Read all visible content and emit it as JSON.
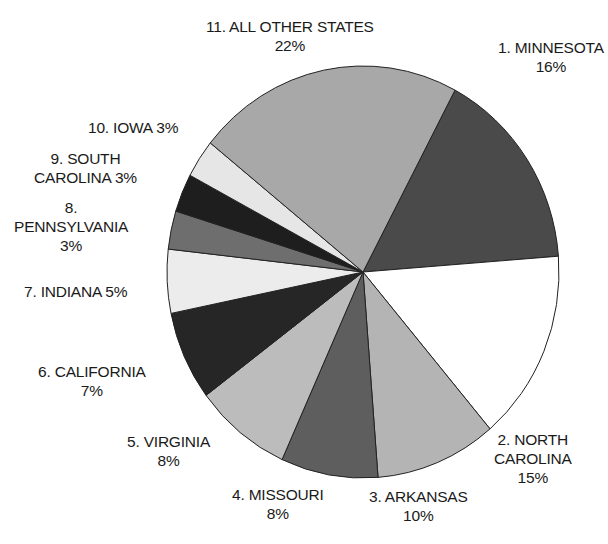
{
  "chart_data": {
    "type": "pie",
    "title": "",
    "start_angle_deg": 28,
    "direction": "clockwise",
    "slices": [
      {
        "rank": 1,
        "label": "MINNESOTA",
        "value": 16,
        "fill": "#4a4a4a"
      },
      {
        "rank": 2,
        "label": "NORTH CAROLINA",
        "value": 15,
        "fill": "#ffffff"
      },
      {
        "rank": 3,
        "label": "ARKANSAS",
        "value": 10,
        "fill": "#b4b4b4"
      },
      {
        "rank": 4,
        "label": "MISSOURI",
        "value": 8,
        "fill": "#5e5e5e"
      },
      {
        "rank": 5,
        "label": "VIRGINIA",
        "value": 8,
        "fill": "#bcbcbc"
      },
      {
        "rank": 6,
        "label": "CALIFORNIA",
        "value": 7,
        "fill": "#262626"
      },
      {
        "rank": 7,
        "label": "INDIANA",
        "value": 5,
        "fill": "#ececec"
      },
      {
        "rank": 8,
        "label": "PENNSYLVANIA",
        "value": 3,
        "fill": "#6e6e6e"
      },
      {
        "rank": 9,
        "label": "SOUTH CAROLINA",
        "value": 3,
        "fill": "#1e1e1e"
      },
      {
        "rank": 10,
        "label": "IOWA",
        "value": 3,
        "fill": "#e6e6e6"
      },
      {
        "rank": 11,
        "label": "ALL OTHER STATES",
        "value": 22,
        "fill": "#a8a8a8"
      }
    ]
  },
  "labels": {
    "l1": {
      "line1": "1. MINNESOTA",
      "line2": "16%"
    },
    "l2": {
      "line1": "2. NORTH",
      "line2": "CAROLINA",
      "line3": "15%"
    },
    "l3": {
      "line1": "3. ARKANSAS",
      "line2": "10%"
    },
    "l4": {
      "line1": "4. MISSOURI",
      "line2": "8%"
    },
    "l5": {
      "line1": "5. VIRGINIA",
      "line2": "8%"
    },
    "l6": {
      "line1": "6. CALIFORNIA",
      "line2": "7%"
    },
    "l7": {
      "line1": "7. INDIANA 5%"
    },
    "l8": {
      "line1": "8.",
      "line2": "PENNSYLVANIA",
      "line3": "3%"
    },
    "l9": {
      "line1": "9. SOUTH",
      "line2": "CAROLINA 3%"
    },
    "l10": {
      "line1": "10. IOWA 3%"
    },
    "l11": {
      "line1": "11. ALL OTHER STATES",
      "line2": "22%"
    }
  }
}
